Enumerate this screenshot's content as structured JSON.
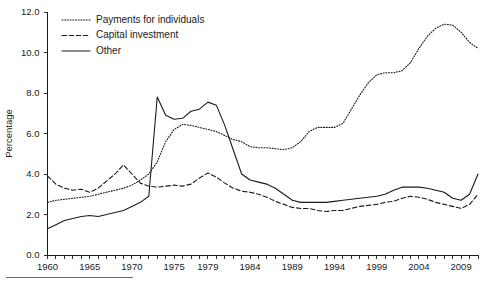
{
  "chart_data": {
    "type": "line",
    "title": "",
    "xlabel": "",
    "ylabel": "Percentage",
    "xlim": [
      1960,
      2011
    ],
    "ylim": [
      0.0,
      12.0
    ],
    "grid": false,
    "legend_position": "top-left",
    "y_ticks": [
      "0.0",
      "2.0",
      "4.0",
      "6.0",
      "8.0",
      "10.0",
      "12.0"
    ],
    "y_tick_values": [
      0.0,
      2.0,
      4.0,
      6.0,
      8.0,
      10.0,
      12.0
    ],
    "x_ticks": [
      "1960",
      "1965",
      "1970",
      "1975",
      "1979",
      "1984",
      "1989",
      "1994",
      "1999",
      "2004",
      "2009"
    ],
    "x_tick_values": [
      1960,
      1965,
      1970,
      1975,
      1979,
      1984,
      1989,
      1994,
      1999,
      2004,
      2009
    ],
    "x": [
      1960,
      1961,
      1962,
      1963,
      1964,
      1965,
      1966,
      1967,
      1968,
      1969,
      1970,
      1971,
      1972,
      1973,
      1974,
      1975,
      1976,
      1977,
      1978,
      1979,
      1980,
      1981,
      1982,
      1983,
      1984,
      1985,
      1986,
      1987,
      1988,
      1989,
      1990,
      1991,
      1992,
      1993,
      1994,
      1995,
      1996,
      1997,
      1998,
      1999,
      2000,
      2001,
      2002,
      2003,
      2004,
      2005,
      2006,
      2007,
      2008,
      2009,
      2010,
      2011
    ],
    "series": [
      {
        "name": "Payments for individuals",
        "style": "dotted",
        "values": [
          2.6,
          2.7,
          2.75,
          2.8,
          2.85,
          2.9,
          3.0,
          3.1,
          3.2,
          3.3,
          3.45,
          3.7,
          4.0,
          4.6,
          5.6,
          6.2,
          6.45,
          6.4,
          6.3,
          6.2,
          6.1,
          5.9,
          5.7,
          5.6,
          5.35,
          5.3,
          5.3,
          5.25,
          5.2,
          5.3,
          5.6,
          6.1,
          6.3,
          6.3,
          6.3,
          6.5,
          7.2,
          7.9,
          8.5,
          8.9,
          9.0,
          9.0,
          9.1,
          9.5,
          10.2,
          10.8,
          11.2,
          11.4,
          11.35,
          11.0,
          10.5,
          10.2
        ]
      },
      {
        "name": "Capital investment",
        "style": "dashed",
        "values": [
          3.9,
          3.5,
          3.3,
          3.2,
          3.25,
          3.1,
          3.3,
          3.65,
          4.0,
          4.45,
          4.0,
          3.55,
          3.4,
          3.35,
          3.4,
          3.45,
          3.4,
          3.5,
          3.8,
          4.05,
          3.85,
          3.55,
          3.3,
          3.15,
          3.1,
          3.0,
          2.85,
          2.65,
          2.5,
          2.35,
          2.3,
          2.3,
          2.2,
          2.15,
          2.2,
          2.2,
          2.3,
          2.4,
          2.45,
          2.5,
          2.6,
          2.65,
          2.8,
          2.9,
          2.85,
          2.75,
          2.6,
          2.5,
          2.4,
          2.3,
          2.5,
          3.0
        ]
      },
      {
        "name": "Other",
        "style": "solid",
        "values": [
          1.3,
          1.5,
          1.7,
          1.8,
          1.9,
          1.95,
          1.9,
          2.0,
          2.1,
          2.2,
          2.4,
          2.6,
          2.9,
          7.8,
          6.9,
          6.7,
          6.75,
          7.1,
          7.2,
          7.55,
          7.4,
          6.4,
          5.2,
          4.0,
          3.7,
          3.6,
          3.5,
          3.3,
          3.0,
          2.7,
          2.6,
          2.6,
          2.6,
          2.6,
          2.65,
          2.7,
          2.75,
          2.8,
          2.85,
          2.9,
          3.0,
          3.2,
          3.35,
          3.35,
          3.35,
          3.3,
          3.2,
          3.1,
          2.8,
          2.7,
          3.0,
          4.0
        ]
      }
    ]
  },
  "legend": {
    "items": [
      {
        "label": "Payments for individuals",
        "style": "dotted"
      },
      {
        "label": "Capital investment",
        "style": "dashed"
      },
      {
        "label": "Other",
        "style": "solid"
      }
    ]
  }
}
